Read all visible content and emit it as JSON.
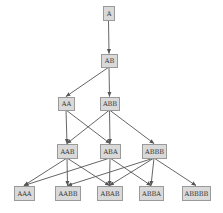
{
  "diagram": {
    "type": "directed-acyclic-graph",
    "colors": {
      "node_fill": "#d9d9d9",
      "node_border": "#9a9a9a",
      "edge": "#555555",
      "text": "#333333",
      "background": "#ffffff"
    },
    "nodes": [
      {
        "id": "A",
        "label": "A",
        "x": 103,
        "y": 6,
        "w": 11,
        "h": 14
      },
      {
        "id": "AB",
        "label": "AB",
        "x": 101,
        "y": 54,
        "w": 16,
        "h": 13
      },
      {
        "id": "AA",
        "label": "AA",
        "x": 58,
        "y": 97,
        "w": 16,
        "h": 13
      },
      {
        "id": "ABB",
        "label": "ABB",
        "x": 100,
        "y": 97,
        "w": 19,
        "h": 13
      },
      {
        "id": "AAB",
        "label": "AAB",
        "x": 57,
        "y": 144,
        "w": 20,
        "h": 14
      },
      {
        "id": "ABA",
        "label": "ABA",
        "x": 100,
        "y": 144,
        "w": 20,
        "h": 14
      },
      {
        "id": "ABBB",
        "label": "ABBB",
        "x": 142,
        "y": 144,
        "w": 24,
        "h": 14
      },
      {
        "id": "AAA",
        "label": "AAA",
        "x": 14,
        "y": 186,
        "w": 20,
        "h": 14
      },
      {
        "id": "AABB",
        "label": "AABB",
        "x": 55,
        "y": 186,
        "w": 25,
        "h": 14
      },
      {
        "id": "ABAB",
        "label": "ABAB",
        "x": 97,
        "y": 186,
        "w": 25,
        "h": 14
      },
      {
        "id": "ABBA",
        "label": "ABBA",
        "x": 139,
        "y": 186,
        "w": 24,
        "h": 14
      },
      {
        "id": "ABBBB",
        "label": "ABBBB",
        "x": 182,
        "y": 186,
        "w": 28,
        "h": 14
      }
    ],
    "edges": [
      {
        "from": "A",
        "to": "AB"
      },
      {
        "from": "AB",
        "to": "AA"
      },
      {
        "from": "AB",
        "to": "ABB"
      },
      {
        "from": "AA",
        "to": "AAB"
      },
      {
        "from": "AA",
        "to": "ABA"
      },
      {
        "from": "ABB",
        "to": "AAB"
      },
      {
        "from": "ABB",
        "to": "ABA"
      },
      {
        "from": "ABB",
        "to": "ABBB"
      },
      {
        "from": "AAB",
        "to": "AAA"
      },
      {
        "from": "AAB",
        "to": "AABB"
      },
      {
        "from": "AAB",
        "to": "ABAB"
      },
      {
        "from": "ABA",
        "to": "AAA"
      },
      {
        "from": "ABA",
        "to": "ABAB"
      },
      {
        "from": "ABA",
        "to": "ABBA"
      },
      {
        "from": "ABBB",
        "to": "AABB"
      },
      {
        "from": "ABBB",
        "to": "ABAB"
      },
      {
        "from": "ABBB",
        "to": "ABBA"
      },
      {
        "from": "ABBB",
        "to": "ABBBB"
      }
    ]
  }
}
